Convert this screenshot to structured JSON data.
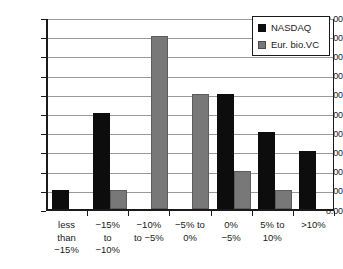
{
  "chart_data": {
    "type": "bar",
    "title": "",
    "xlabel": "",
    "ylabel": "",
    "ylim": [
      0,
      10
    ],
    "ytick_step": 1,
    "ytick_labels": [
      "0.00",
      "1.00",
      "2.00",
      "3.00",
      "4.00",
      "5.00",
      "6.00",
      "7.00",
      "8.00",
      "9.00",
      "10.00"
    ],
    "grid": true,
    "grid_axis": "y",
    "legend_position": "top-right",
    "categories": [
      "less\nthan\n−15%",
      "−15%\nto\n−10%",
      "−10%\nto −5%",
      "−5% to\n0%",
      "0%\n−5%",
      "5% to\n10%",
      ">10%"
    ],
    "series": [
      {
        "name": "NASDAQ",
        "color": "#0d0d0d",
        "values": [
          1,
          5,
          0,
          0,
          6,
          4,
          3
        ]
      },
      {
        "name": "Eur. bio.VC",
        "color": "#787878",
        "values": [
          0,
          1,
          9,
          6,
          2,
          1,
          0
        ]
      }
    ]
  },
  "legend": {
    "entries": [
      {
        "label": "NASDAQ",
        "swatch": "black-square-icon"
      },
      {
        "label": "Eur. bio.VC",
        "swatch": "gray-square-icon"
      }
    ]
  },
  "colors": {
    "nasdaq": "#0d0d0d",
    "eur_bio_vc": "#787878",
    "axis": "#1a1a1a",
    "gridline": "#9a9a9a",
    "background": "#ffffff"
  }
}
